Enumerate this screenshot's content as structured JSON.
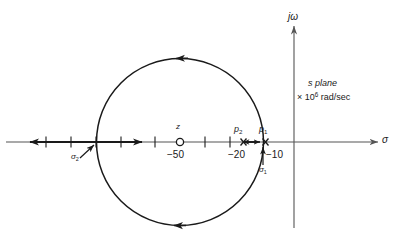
{
  "figure": {
    "axes": {
      "imaginary_axis_label": "jω",
      "real_axis_label": "σ",
      "plane_label": "s plane",
      "scale_label_prefix": "×",
      "scale_label_base": "10",
      "scale_label_exponent": "6",
      "scale_label_units": "rad/sec",
      "scale_label_full": "× 10⁶ rad/sec"
    },
    "tick_labels": [
      {
        "name": "minus-50",
        "text": "−50",
        "value": -50
      },
      {
        "name": "minus-20",
        "text": "−20",
        "value": -20
      },
      {
        "name": "minus-10",
        "text": "−10",
        "value": -10
      }
    ],
    "markers": [
      {
        "name": "zero-z",
        "label": "z",
        "type": "zero",
        "symbol": "open-circle",
        "value": -50
      },
      {
        "name": "pole-p1",
        "label": "p",
        "subscript": "1",
        "type": "pole",
        "symbol": "cross",
        "value": -10
      },
      {
        "name": "pole-p2",
        "label": "p",
        "subscript": "2",
        "type": "pole",
        "symbol": "cross",
        "value": -20
      }
    ],
    "breakaway_points": [
      {
        "name": "sigma-1",
        "label": "σ",
        "subscript": "1",
        "value": -13.5
      },
      {
        "name": "sigma-2",
        "label": "σ",
        "subscript": "2",
        "value": -100
      }
    ],
    "locus": {
      "type": "circle",
      "center_value": -50,
      "radius_value": 43,
      "direction_arrows": [
        "top-leftward",
        "bottom-leftward"
      ]
    },
    "real_axis_segments": [
      {
        "name": "segment-left",
        "from": "-infinity",
        "to": -100,
        "arrow": "leftward"
      },
      {
        "name": "segment-middle",
        "from": -100,
        "to": -20,
        "arrow": "rightward"
      },
      {
        "name": "segment-right",
        "from": -20,
        "to": -10,
        "arrow": "both"
      }
    ],
    "colors": {
      "ink": "#1a1a1a",
      "axis": "#555555",
      "background": "#ffffff"
    }
  }
}
